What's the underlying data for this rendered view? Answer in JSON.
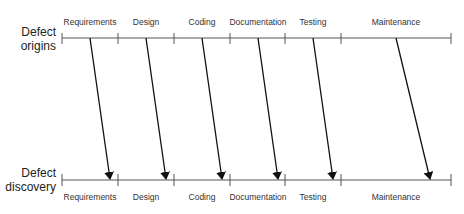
{
  "diagram": {
    "top_label": [
      "Defect",
      "origins"
    ],
    "bottom_label": [
      "Defect",
      "discovery"
    ],
    "phases": [
      "Requirements",
      "Design",
      "Coding",
      "Documentation",
      "Testing",
      "Maintenance"
    ],
    "colors": {
      "axis": "#555555",
      "arrow": "#111111",
      "text": "#333333"
    }
  }
}
